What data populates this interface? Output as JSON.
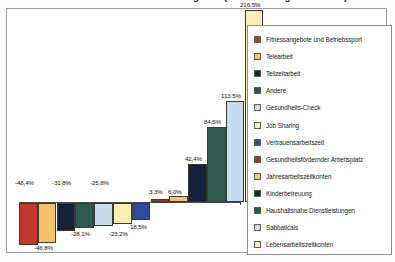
{
  "title": {
    "text": "Anteil der Unternehmen mit Angebot (Veränderung in Prozent)"
  },
  "legend": {
    "position": "right",
    "entries": [
      {
        "label": "Fitnessangebote und Betriebssport",
        "color": "#C0392B"
      },
      {
        "label": "Telearbeit",
        "color": "#F5C36B"
      },
      {
        "label": "Teilzeitarbeit",
        "color": "#13213A"
      },
      {
        "label": "Andere",
        "color": "#2E5B4E"
      },
      {
        "label": "Gesundheits-Check",
        "color": "#C7DCEF"
      },
      {
        "label": "Job Sharing",
        "color": "#FAEEB4"
      },
      {
        "label": "Vertrauensarbeitszeit",
        "color": "#2D4B9A"
      },
      {
        "label": "Gesundheitsfördernder Arbeitsplatz",
        "color": "#A83232"
      },
      {
        "label": "Jahresarbeitszeitkonten",
        "color": "#F0C579"
      },
      {
        "label": "Kinderbetreuung",
        "color": "#13213A"
      },
      {
        "label": "Haushaltsnahe Dienstleistungen",
        "color": "#2E5B4E"
      },
      {
        "label": "Sabbaticals",
        "color": "#C7DCEF"
      },
      {
        "label": "Lebensarbeitszeitkonten",
        "color": "#FAEEB4"
      }
    ]
  },
  "chart_data": {
    "type": "bar",
    "title": "Anteil der Unternehmen mit Angebot (Veränderung in Prozent)",
    "xlabel": "",
    "ylabel": "",
    "grid": false,
    "legend_position": "right",
    "ylim": [
      -60,
      240
    ],
    "unit": "%",
    "decimal_separator": ",",
    "categories": [
      "Fitnessangebote und Betriebssport",
      "Telearbeit",
      "Teilzeitarbeit",
      "Andere",
      "Gesundheits-Check",
      "Job Sharing",
      "Vertrauensarbeitszeit",
      "Gesundheitsfördernder Arbeitsplatz",
      "Jahresarbeitszeitkonten",
      "Kinderbetreuung",
      "Haushaltsnahe Dienstleistungen",
      "Sabbaticals",
      "Lebensarbeitszeitkonten"
    ],
    "values": [
      -48.4,
      -46.8,
      -31.8,
      -28.1,
      -25.8,
      -23.2,
      -18.5,
      3.3,
      6.0,
      42.4,
      84.5,
      113.5,
      216.5
    ],
    "data_labels": [
      "-48,4%",
      "-46,8%",
      "-31,8%",
      "-28,1%",
      "-25,8%",
      "-23,2%",
      "-18,5%",
      "3,3%",
      "6,0%",
      "42,4%",
      "84,5%",
      "113,5%",
      "216,5%"
    ],
    "colors": [
      "#C0392B",
      "#F5C36B",
      "#13213A",
      "#2E5B4E",
      "#C7DCEF",
      "#FAEEB4",
      "#2D4B9A",
      "#A83232",
      "#F0C579",
      "#13213A",
      "#2E5B4E",
      "#C7DCEF",
      "#FAEEB4"
    ]
  },
  "bars": [
    {
      "label": "-48,4%",
      "color": "#C0392B",
      "x": 6,
      "w": 18.5,
      "top": 184,
      "h": 42,
      "lx": 2,
      "ly": 160
    },
    {
      "label": "-46,8%",
      "color": "#F5C36B",
      "x": 24.8,
      "w": 18.5,
      "top": 184,
      "h": 40,
      "lx": 21,
      "ly": 225
    },
    {
      "label": "-31,8%",
      "color": "#13213A",
      "x": 43.6,
      "w": 18.5,
      "top": 184,
      "h": 28,
      "lx": 39,
      "ly": 160
    },
    {
      "label": "-28,1%",
      "color": "#2E5B4E",
      "x": 62.4,
      "w": 18.5,
      "top": 184,
      "h": 25,
      "lx": 58,
      "ly": 211
    },
    {
      "label": "-25,8%",
      "color": "#C7DCEF",
      "x": 81.2,
      "w": 18.5,
      "top": 184,
      "h": 23,
      "lx": 77,
      "ly": 160
    },
    {
      "label": "-23,2%",
      "color": "#FAEEB4",
      "x": 100,
      "w": 18.5,
      "top": 184,
      "h": 21,
      "lx": 96,
      "ly": 211
    },
    {
      "label": "-18,5%",
      "color": "#2D4B9A",
      "x": 118.8,
      "w": 18.5,
      "top": 184,
      "h": 17,
      "lx": 115,
      "ly": 204
    },
    {
      "label": "3,3%",
      "color": "#A83232",
      "x": 137.6,
      "w": 18.5,
      "top": 180,
      "h": 3,
      "lx": 136,
      "ly": 169
    },
    {
      "label": "6,0%",
      "color": "#F0C579",
      "x": 156.4,
      "w": 18.5,
      "top": 177,
      "h": 6,
      "lx": 155,
      "ly": 169
    },
    {
      "label": "42,4%",
      "color": "#13213A",
      "x": 175.2,
      "w": 18.5,
      "top": 145,
      "h": 38,
      "lx": 172,
      "ly": 136
    },
    {
      "label": "84,5%",
      "color": "#2E5B4E",
      "x": 194,
      "w": 18.5,
      "top": 108,
      "h": 75,
      "lx": 191,
      "ly": 99
    },
    {
      "label": "113,5%",
      "color": "#C7DCEF",
      "x": 212.8,
      "w": 18.5,
      "top": 82,
      "h": 101,
      "lx": 208,
      "ly": 73
    },
    {
      "label": "216,5%",
      "color": "#FAEEB4",
      "x": 231.6,
      "w": 18.5,
      "top": -9,
      "h": 192,
      "lx": 227,
      "ly": -18
    }
  ]
}
